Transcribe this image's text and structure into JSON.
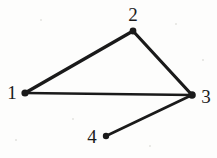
{
  "figure": {
    "type": "undirected-graph-diagram",
    "background_color": "#fdfdfc",
    "ink_color": "#1a1a1a",
    "width": 217,
    "height": 158
  },
  "nodes": [
    {
      "id": "1",
      "label": "1",
      "x": 25,
      "y": 93,
      "label_x": 12,
      "label_y": 92,
      "dot_r": 3.6
    },
    {
      "id": "2",
      "label": "2",
      "x": 133,
      "y": 31,
      "label_x": 133,
      "label_y": 14,
      "dot_r": 3.4
    },
    {
      "id": "3",
      "label": "3",
      "x": 192,
      "y": 95,
      "label_x": 206,
      "label_y": 96,
      "dot_r": 3.8
    },
    {
      "id": "4",
      "label": "4",
      "x": 106,
      "y": 136,
      "label_x": 92,
      "label_y": 136,
      "dot_r": 3.2
    }
  ],
  "edges": [
    {
      "id": "e12",
      "from": "1",
      "to": "2",
      "x1": 25,
      "y1": 93,
      "x2": 133,
      "y2": 31,
      "width": 3.2
    },
    {
      "id": "e23",
      "from": "2",
      "to": "3",
      "x1": 133,
      "y1": 31,
      "x2": 192,
      "y2": 95,
      "width": 3.2
    },
    {
      "id": "e13",
      "from": "1",
      "to": "3",
      "x1": 25,
      "y1": 93,
      "x2": 192,
      "y2": 95,
      "width": 2.4
    },
    {
      "id": "e34",
      "from": "3",
      "to": "4",
      "x1": 192,
      "y1": 95,
      "x2": 106,
      "y2": 136,
      "width": 2.6
    }
  ],
  "specks": [
    {
      "x": 41,
      "y": 20,
      "r": 1.1
    },
    {
      "x": 176,
      "y": 24,
      "r": 0.9
    },
    {
      "x": 73,
      "y": 119,
      "r": 1.0
    },
    {
      "x": 150,
      "y": 146,
      "r": 0.9
    },
    {
      "x": 16,
      "y": 140,
      "r": 0.8
    },
    {
      "x": 203,
      "y": 60,
      "r": 0.8
    }
  ]
}
